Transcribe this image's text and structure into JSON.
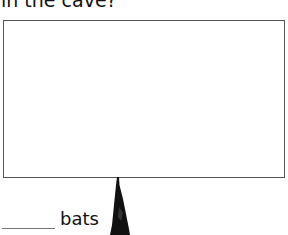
{
  "question": {
    "text": "in the cave?"
  },
  "drawing_box": {
    "label": ""
  },
  "answer": {
    "blank": "",
    "unit": "bats"
  },
  "illustration": {
    "icon": "hanging-bat-icon"
  }
}
